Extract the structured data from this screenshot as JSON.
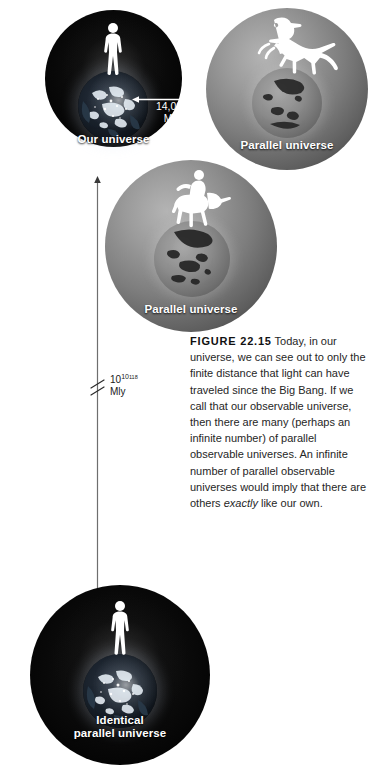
{
  "figure": {
    "background_color": "#ffffff",
    "caption_number": "FIGURE 22.15",
    "caption_body_1": " Today, in our universe, we can see out to only the finite distance that light can have traveled since the Big Bang. If we call that our observable universe, then there are many (perhaps an infinite number) of parallel observable universes. An infinite number of parallel observable universes would imply that there are others ",
    "caption_italic": "exactly",
    "caption_body_2": " like our own."
  },
  "universes": [
    {
      "id": "our-universe",
      "label": "Our universe",
      "tone": "dark",
      "inhabitant": "human",
      "globe": "earth-night"
    },
    {
      "id": "parallel-universe-dinosaur",
      "label": "Parallel universe",
      "tone": "gray",
      "inhabitant": "dinosaur",
      "globe": "earth-gray"
    },
    {
      "id": "parallel-universe-centaur",
      "label": "Parallel universe",
      "tone": "gray",
      "inhabitant": "centaur",
      "globe": "earth-gray"
    },
    {
      "id": "identical-parallel-universe",
      "label_line_1": "Identical",
      "label_line_2": "parallel universe",
      "tone": "dark",
      "inhabitant": "human",
      "globe": "earth-night"
    }
  ],
  "measurements": {
    "radius": {
      "value": "14,000",
      "unit": "Mly",
      "orientation": "horizontal",
      "color": "#ffffff"
    },
    "separation": {
      "base": "10",
      "exponent": "10",
      "exponent_of_exponent": "118",
      "unit": "Mly",
      "orientation": "vertical",
      "has_break_mark": true,
      "color": "#1a1a1a"
    }
  }
}
